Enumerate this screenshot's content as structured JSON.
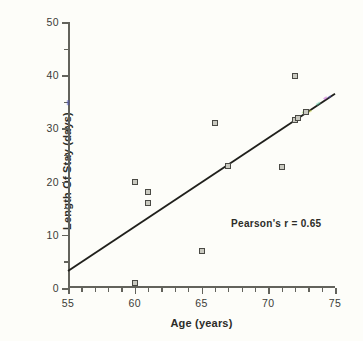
{
  "chart_data": {
    "type": "scatter",
    "title": "",
    "xlabel": "Age  (years)",
    "ylabel": "Length Of Stay (days)",
    "xlim": [
      55,
      75
    ],
    "ylim": [
      0,
      50
    ],
    "xticks": [
      55,
      60,
      65,
      70,
      75
    ],
    "yticks": [
      0,
      10,
      20,
      30,
      40,
      50
    ],
    "xtick_labels": [
      "55",
      "60",
      "65",
      "70",
      "75"
    ],
    "ytick_labels": [
      "0",
      "10",
      "20",
      "30",
      "40",
      "50"
    ],
    "x_minor_step": 1,
    "y_minor_step": 5,
    "grid": false,
    "legend": false,
    "annotations": [
      {
        "text": "Pearson's  r  =  0.65",
        "x": 70.6,
        "y": 12.2
      }
    ],
    "points": [
      {
        "x": 60.0,
        "y": 1.0
      },
      {
        "x": 60.0,
        "y": 20.0
      },
      {
        "x": 61.0,
        "y": 16.0
      },
      {
        "x": 61.0,
        "y": 18.0
      },
      {
        "x": 65.0,
        "y": 7.0
      },
      {
        "x": 66.0,
        "y": 31.0
      },
      {
        "x": 67.0,
        "y": 23.0
      },
      {
        "x": 71.0,
        "y": 22.8
      },
      {
        "x": 72.0,
        "y": 31.6
      },
      {
        "x": 72.2,
        "y": 31.9
      },
      {
        "x": 72.0,
        "y": 39.8
      },
      {
        "x": 72.8,
        "y": 33.0
      }
    ],
    "trend_line": {
      "x_start": 55.0,
      "y_start": 3.2,
      "x_end": 75.0,
      "y_end": 36.5
    },
    "marker_style": {
      "shape": "square-open",
      "edge_color": "#4a4a45",
      "face_color": "#c9c9c0",
      "size_px": 6
    },
    "line_color": "#20201c",
    "axis_color": "#63635c",
    "background_color": "#fdfdf9"
  }
}
